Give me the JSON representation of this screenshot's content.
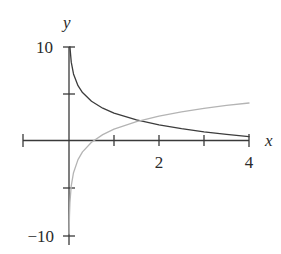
{
  "labels": {
    "y_axis": "y",
    "x_axis": "x",
    "y_top": "10",
    "y_bottom": "−10",
    "x_tick_2": "2",
    "x_tick_4": "4"
  },
  "colors": {
    "axis": "#3a3a3a",
    "decreasing_curve": "#3c3c3c",
    "increasing_curve": "#b4b4b4"
  },
  "chart_data": {
    "type": "line",
    "title": "",
    "xlabel": "x",
    "ylabel": "y",
    "xlim": [
      -1,
      4
    ],
    "ylim": [
      -10,
      10
    ],
    "grid": false,
    "legend": null,
    "x_ticks": [
      -1,
      1,
      2,
      3,
      4
    ],
    "x_tick_labels": {
      "2": "2",
      "4": "4"
    },
    "y_ticks": [
      -10,
      -5,
      5,
      10
    ],
    "y_tick_labels": {
      "10": "10",
      "-10": "−10"
    },
    "series": [
      {
        "name": "decreasing curve (dark)",
        "color": "#3c3c3c",
        "points": [
          [
            0.02,
            9.94
          ],
          [
            0.05,
            8.29
          ],
          [
            0.1,
            7.04
          ],
          [
            0.2,
            5.8
          ],
          [
            0.3,
            5.07
          ],
          [
            0.5,
            4.15
          ],
          [
            0.75,
            3.42
          ],
          [
            1,
            2.9
          ],
          [
            1.5,
            2.17
          ],
          [
            2,
            1.65
          ],
          [
            2.5,
            1.25
          ],
          [
            3,
            0.92
          ],
          [
            3.5,
            0.65
          ],
          [
            4,
            0.4
          ]
        ]
      },
      {
        "name": "increasing curve (gray)",
        "color": "#b4b4b4",
        "points": [
          [
            0.004,
            -9.84
          ],
          [
            0.01,
            -8.01
          ],
          [
            0.02,
            -6.62
          ],
          [
            0.05,
            -4.79
          ],
          [
            0.1,
            -3.41
          ],
          [
            0.2,
            -2.02
          ],
          [
            0.3,
            -1.21
          ],
          [
            0.5,
            -0.19
          ],
          [
            0.75,
            0.62
          ],
          [
            1,
            1.2
          ],
          [
            1.5,
            2.01
          ],
          [
            2,
            2.59
          ],
          [
            2.5,
            3.03
          ],
          [
            3,
            3.4
          ],
          [
            3.5,
            3.71
          ],
          [
            4,
            3.97
          ]
        ]
      }
    ]
  }
}
